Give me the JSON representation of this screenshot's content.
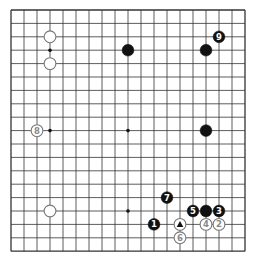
{
  "board": {
    "size": 19,
    "origin_x": 11,
    "origin_y": 10,
    "step_x": 13,
    "step_y": 13.4,
    "line_color": "#333333",
    "star_points": [
      [
        3,
        3
      ],
      [
        9,
        3
      ],
      [
        15,
        3
      ],
      [
        3,
        9
      ],
      [
        9,
        9
      ],
      [
        15,
        9
      ],
      [
        3,
        15
      ],
      [
        9,
        15
      ],
      [
        15,
        15
      ]
    ]
  },
  "stones": [
    {
      "col": 3,
      "row": 2,
      "color": "white",
      "label": ""
    },
    {
      "col": 3,
      "row": 4,
      "color": "white",
      "label": ""
    },
    {
      "col": 9,
      "row": 3,
      "color": "black",
      "label": ""
    },
    {
      "col": 15,
      "row": 3,
      "color": "black",
      "label": ""
    },
    {
      "col": 16,
      "row": 2,
      "color": "black",
      "label": "9"
    },
    {
      "col": 2,
      "row": 9,
      "color": "white",
      "label": "8"
    },
    {
      "col": 15,
      "row": 9,
      "color": "black",
      "label": ""
    },
    {
      "col": 3,
      "row": 15,
      "color": "white",
      "label": ""
    },
    {
      "col": 12,
      "row": 14,
      "color": "black",
      "label": "7"
    },
    {
      "col": 14,
      "row": 15,
      "color": "black",
      "label": "5"
    },
    {
      "col": 15,
      "row": 15,
      "color": "black",
      "label": ""
    },
    {
      "col": 16,
      "row": 15,
      "color": "black",
      "label": "3"
    },
    {
      "col": 11,
      "row": 16,
      "color": "black",
      "label": "1"
    },
    {
      "col": 13,
      "row": 16,
      "color": "white",
      "label": "",
      "marker": "triangle"
    },
    {
      "col": 15,
      "row": 16,
      "color": "white",
      "label": "4"
    },
    {
      "col": 16,
      "row": 16,
      "color": "white",
      "label": "2"
    },
    {
      "col": 13,
      "row": 17,
      "color": "white",
      "label": "6"
    }
  ]
}
